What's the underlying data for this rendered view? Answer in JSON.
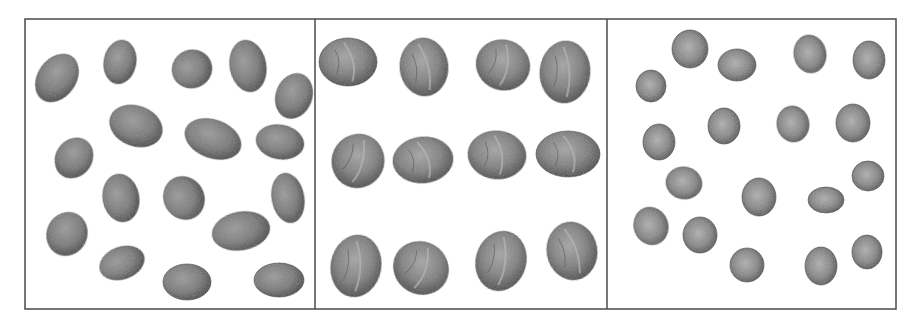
{
  "figure": {
    "frame": {
      "x": 25,
      "y": 19,
      "width": 871,
      "height": 290,
      "stroke": "#4a4a4a"
    },
    "dividers": [
      315,
      607
    ],
    "colors": {
      "seed_dark": "#3d3d3d",
      "seed_mid": "#7a7a7a",
      "seed_light": "#a8a8a8",
      "ridge": "#b5b5b5"
    },
    "panels": [
      {
        "name": "oval-seeds",
        "type": "elongated-seed",
        "items": [
          {
            "cx": 57,
            "cy": 78,
            "rx": 19,
            "ry": 26,
            "rot": 35
          },
          {
            "cx": 120,
            "cy": 62,
            "rx": 16,
            "ry": 22,
            "rot": 10
          },
          {
            "cx": 192,
            "cy": 69,
            "rx": 20,
            "ry": 19,
            "rot": -20
          },
          {
            "cx": 248,
            "cy": 66,
            "rx": 18,
            "ry": 26,
            "rot": -10
          },
          {
            "cx": 294,
            "cy": 96,
            "rx": 18,
            "ry": 23,
            "rot": 20
          },
          {
            "cx": 136,
            "cy": 126,
            "rx": 27,
            "ry": 20,
            "rot": 20
          },
          {
            "cx": 213,
            "cy": 139,
            "rx": 29,
            "ry": 19,
            "rot": 20
          },
          {
            "cx": 280,
            "cy": 142,
            "rx": 24,
            "ry": 17,
            "rot": 10
          },
          {
            "cx": 74,
            "cy": 158,
            "rx": 18,
            "ry": 21,
            "rot": 35
          },
          {
            "cx": 121,
            "cy": 198,
            "rx": 18,
            "ry": 24,
            "rot": -10
          },
          {
            "cx": 184,
            "cy": 198,
            "rx": 20,
            "ry": 22,
            "rot": -30
          },
          {
            "cx": 288,
            "cy": 198,
            "rx": 16,
            "ry": 25,
            "rot": -10
          },
          {
            "cx": 67,
            "cy": 234,
            "rx": 20,
            "ry": 22,
            "rot": 25
          },
          {
            "cx": 241,
            "cy": 231,
            "rx": 29,
            "ry": 19,
            "rot": -10
          },
          {
            "cx": 122,
            "cy": 263,
            "rx": 23,
            "ry": 16,
            "rot": -20
          },
          {
            "cx": 187,
            "cy": 282,
            "rx": 24,
            "ry": 18,
            "rot": 0
          },
          {
            "cx": 279,
            "cy": 280,
            "rx": 25,
            "ry": 17,
            "rot": 0
          }
        ]
      },
      {
        "name": "walnuts",
        "type": "wrinkled-nut",
        "items": [
          {
            "cx": 348,
            "cy": 62,
            "rx": 29,
            "ry": 24,
            "rot": 0
          },
          {
            "cx": 424,
            "cy": 67,
            "rx": 24,
            "ry": 29,
            "rot": -5
          },
          {
            "cx": 503,
            "cy": 65,
            "rx": 27,
            "ry": 25,
            "rot": 20
          },
          {
            "cx": 565,
            "cy": 72,
            "rx": 25,
            "ry": 31,
            "rot": 5
          },
          {
            "cx": 358,
            "cy": 161,
            "rx": 26,
            "ry": 27,
            "rot": 25
          },
          {
            "cx": 423,
            "cy": 160,
            "rx": 30,
            "ry": 23,
            "rot": -5
          },
          {
            "cx": 497,
            "cy": 155,
            "rx": 29,
            "ry": 24,
            "rot": 5
          },
          {
            "cx": 568,
            "cy": 154,
            "rx": 32,
            "ry": 23,
            "rot": 0
          },
          {
            "cx": 356,
            "cy": 266,
            "rx": 25,
            "ry": 31,
            "rot": 10
          },
          {
            "cx": 421,
            "cy": 268,
            "rx": 28,
            "ry": 26,
            "rot": 30
          },
          {
            "cx": 501,
            "cy": 261,
            "rx": 25,
            "ry": 30,
            "rot": 15
          },
          {
            "cx": 572,
            "cy": 251,
            "rx": 25,
            "ry": 29,
            "rot": -10
          }
        ]
      },
      {
        "name": "round-seeds",
        "type": "round-seed",
        "items": [
          {
            "cx": 690,
            "cy": 49,
            "rx": 18,
            "ry": 19,
            "rot": 0
          },
          {
            "cx": 737,
            "cy": 65,
            "rx": 19,
            "ry": 16,
            "rot": 0
          },
          {
            "cx": 810,
            "cy": 54,
            "rx": 16,
            "ry": 19,
            "rot": -10
          },
          {
            "cx": 869,
            "cy": 60,
            "rx": 16,
            "ry": 19,
            "rot": 0
          },
          {
            "cx": 651,
            "cy": 86,
            "rx": 15,
            "ry": 16,
            "rot": 0
          },
          {
            "cx": 724,
            "cy": 126,
            "rx": 16,
            "ry": 18,
            "rot": 0
          },
          {
            "cx": 793,
            "cy": 124,
            "rx": 16,
            "ry": 18,
            "rot": -10
          },
          {
            "cx": 853,
            "cy": 123,
            "rx": 17,
            "ry": 19,
            "rot": 0
          },
          {
            "cx": 659,
            "cy": 142,
            "rx": 16,
            "ry": 18,
            "rot": 0
          },
          {
            "cx": 684,
            "cy": 183,
            "rx": 18,
            "ry": 16,
            "rot": 10
          },
          {
            "cx": 759,
            "cy": 197,
            "rx": 17,
            "ry": 19,
            "rot": 0
          },
          {
            "cx": 826,
            "cy": 200,
            "rx": 18,
            "ry": 13,
            "rot": 0
          },
          {
            "cx": 868,
            "cy": 176,
            "rx": 16,
            "ry": 15,
            "rot": 0
          },
          {
            "cx": 651,
            "cy": 226,
            "rx": 17,
            "ry": 19,
            "rot": -20
          },
          {
            "cx": 700,
            "cy": 235,
            "rx": 17,
            "ry": 18,
            "rot": 0
          },
          {
            "cx": 747,
            "cy": 265,
            "rx": 17,
            "ry": 17,
            "rot": 0
          },
          {
            "cx": 821,
            "cy": 266,
            "rx": 16,
            "ry": 19,
            "rot": 0
          },
          {
            "cx": 867,
            "cy": 252,
            "rx": 15,
            "ry": 17,
            "rot": 0
          }
        ]
      }
    ]
  }
}
